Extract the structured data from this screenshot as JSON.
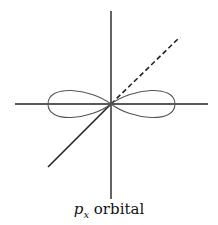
{
  "diagram": {
    "caption": {
      "symbol": "p",
      "subscript": "x",
      "word": "orbital"
    },
    "elements": [
      {
        "type": "axis",
        "name": "x-axis",
        "style": "solid"
      },
      {
        "type": "axis",
        "name": "z-axis",
        "style": "solid"
      },
      {
        "type": "axis",
        "name": "y-axis-front",
        "style": "solid"
      },
      {
        "type": "axis",
        "name": "y-axis-back",
        "style": "dashed"
      },
      {
        "type": "lobe",
        "name": "left-lobe"
      },
      {
        "type": "lobe",
        "name": "right-lobe"
      }
    ],
    "colors": {
      "line": "#222222",
      "lobe": "#555555",
      "background": "#ffffff"
    }
  }
}
